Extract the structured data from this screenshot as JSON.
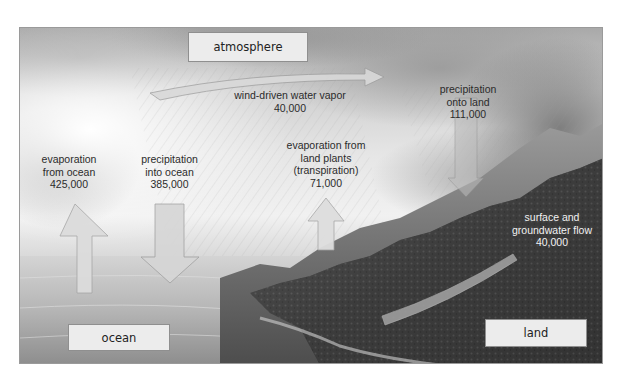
{
  "diagram": {
    "reservoirs": {
      "atmosphere": "atmosphere",
      "ocean": "ocean",
      "land": "land"
    },
    "flows": [
      {
        "id": "evaporation-ocean",
        "lines": [
          "evaporation",
          "from ocean"
        ],
        "value": "425,000",
        "direction": "up"
      },
      {
        "id": "precipitation-ocean",
        "lines": [
          "precipitation",
          "into ocean"
        ],
        "value": "385,000",
        "direction": "down"
      },
      {
        "id": "wind-vapor",
        "lines": [
          "wind-driven water vapor"
        ],
        "value": "40,000",
        "direction": "right"
      },
      {
        "id": "transpiration",
        "lines": [
          "evaporation from",
          "land plants",
          "(transpiration)"
        ],
        "value": "71,000",
        "direction": "up"
      },
      {
        "id": "precipitation-land",
        "lines": [
          "precipitation",
          "onto land"
        ],
        "value": "111,000",
        "direction": "down"
      },
      {
        "id": "groundwater-flow",
        "lines": [
          "surface and",
          "groundwater flow"
        ],
        "value": "40,000",
        "direction": "down-left"
      }
    ],
    "colors": {
      "arrow_fill": "#d9d9d9",
      "arrow_stroke": "#9c9c9c",
      "box_fill": "#ececec",
      "box_border": "#8f8f8f",
      "text_dark": "#2b2b2b",
      "text_light": "#f2f2f2"
    }
  }
}
